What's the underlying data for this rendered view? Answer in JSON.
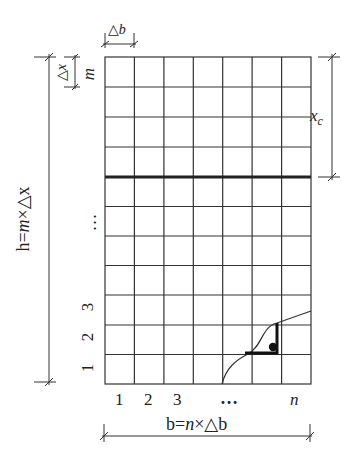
{
  "grid": {
    "columns": 7,
    "rows": 11,
    "left": 105,
    "top": 57,
    "right": 311,
    "bottom": 384,
    "thick_row_line_y": 177,
    "line_color": "#333333",
    "thick_line_color": "#222222"
  },
  "labels": {
    "delta_b": "△b",
    "delta_x": "△x",
    "m_top": "m",
    "x_c": "x",
    "x_c_sub": "c",
    "row_numbers": [
      "1",
      "2",
      "3"
    ],
    "row_ellipsis": "…",
    "col_numbers": [
      "1",
      "2",
      "3"
    ],
    "col_ellipsis": "…",
    "col_n": "n",
    "height_formula_prefix": "h=",
    "height_formula_m": "m",
    "height_formula_suffix": "×△x",
    "width_formula_prefix": "b=",
    "width_formula_n": "n",
    "width_formula_suffix": "×△b"
  },
  "curve": {
    "description": "boundary curve crossing lower-right cells",
    "stroke": "#333333"
  },
  "marker": {
    "description": "filled dot with thick L-shaped path",
    "color": "#111111"
  }
}
